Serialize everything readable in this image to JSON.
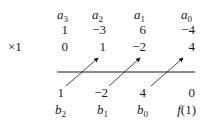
{
  "header": [
    {
      "base": "a",
      "sub": "3"
    },
    {
      "base": "a",
      "sub": "2"
    },
    {
      "base": "a",
      "sub": "1"
    },
    {
      "base": "a",
      "sub": "0"
    }
  ],
  "coefficients": [
    "1",
    "−3",
    "6",
    "−4"
  ],
  "multiplier_label": "×1",
  "products": [
    "0",
    "1",
    "−2",
    "4"
  ],
  "results": [
    "1",
    "−2",
    "4",
    "0"
  ],
  "footer": [
    {
      "base": "b",
      "sub": "2"
    },
    {
      "base": "b",
      "sub": "1"
    },
    {
      "base": "b",
      "sub": "0"
    },
    {
      "base": "f",
      "sub": "",
      "suffix": "(1)"
    }
  ],
  "arrows": [
    {
      "from": "results.0",
      "to": "products.1"
    },
    {
      "from": "results.1",
      "to": "products.2"
    },
    {
      "from": "results.2",
      "to": "products.3"
    }
  ],
  "colors": {
    "ink": "#1a1a1a",
    "background": "#ffffff"
  }
}
